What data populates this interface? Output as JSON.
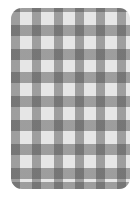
{
  "image": {
    "subject": "gingham fabric swatch",
    "pattern": "checkered / gingham",
    "shape": "rounded rectangle"
  },
  "colors": {
    "background": "#ffffff",
    "light_square": "#e6e6e6",
    "medium_stripe": "#a8a8a8",
    "dark_intersection": "#6a6a6a"
  }
}
